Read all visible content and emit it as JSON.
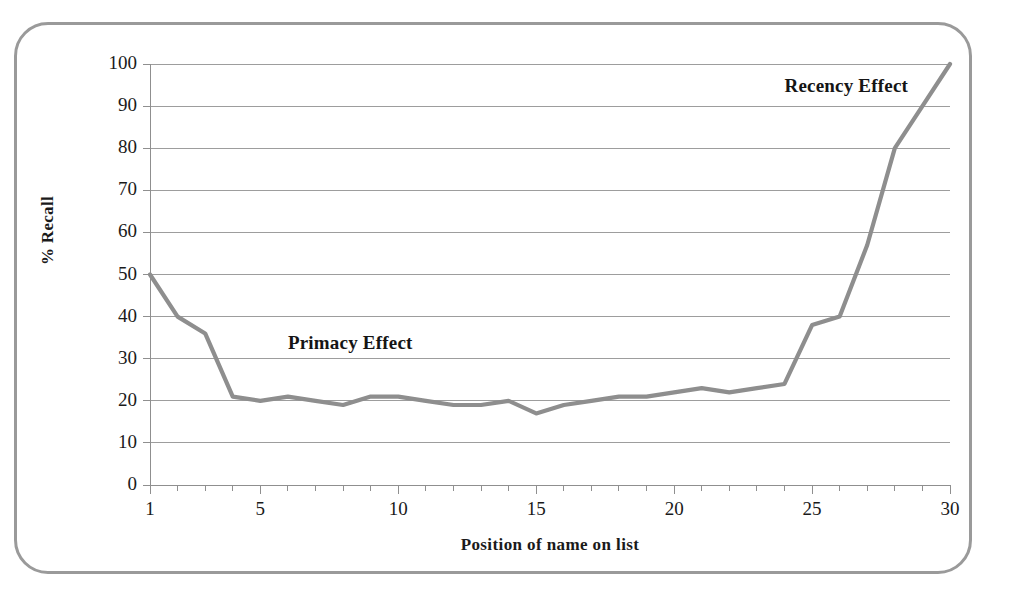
{
  "figure": {
    "border_color": "#9a9a9a",
    "background": "#ffffff"
  },
  "chart_data": {
    "type": "line",
    "title": "",
    "xlabel": "Position of name on list",
    "ylabel": "% Recall",
    "xlim": [
      1,
      30
    ],
    "ylim": [
      0,
      100
    ],
    "grid": true,
    "grid_axis": "y",
    "legend": "none",
    "line_color": "#8e8e8e",
    "x": [
      1,
      2,
      3,
      4,
      5,
      6,
      7,
      8,
      9,
      10,
      11,
      12,
      13,
      14,
      15,
      16,
      17,
      18,
      19,
      20,
      21,
      22,
      23,
      24,
      25,
      26,
      27,
      28,
      29,
      30
    ],
    "values": [
      50,
      40,
      36,
      21,
      20,
      21,
      20,
      19,
      21,
      21,
      20,
      19,
      19,
      20,
      17,
      19,
      20,
      21,
      21,
      22,
      23,
      22,
      23,
      24,
      38,
      40,
      57,
      80,
      90,
      100
    ],
    "y_ticks": [
      0,
      10,
      20,
      30,
      40,
      50,
      60,
      70,
      80,
      90,
      100
    ],
    "y_tick_labels": [
      "0",
      "10",
      "20",
      "30",
      "40",
      "50",
      "60",
      "70",
      "80",
      "90",
      "100"
    ],
    "x_ticks": [
      1,
      2,
      3,
      4,
      5,
      6,
      7,
      8,
      9,
      10,
      11,
      12,
      13,
      14,
      15,
      16,
      17,
      18,
      19,
      20,
      21,
      22,
      23,
      24,
      25,
      26,
      27,
      28,
      29,
      30
    ],
    "x_labeled_ticks": [
      1,
      5,
      10,
      15,
      20,
      25,
      30
    ],
    "x_tick_labels": [
      "1",
      "5",
      "10",
      "15",
      "20",
      "25",
      "30"
    ],
    "annotations": [
      {
        "text": "Primacy Effect",
        "x": 6.0,
        "y": 33.5,
        "name": "primacy-effect-annotation"
      },
      {
        "text": "Recency Effect",
        "x": 24.0,
        "y": 94.5,
        "name": "recency-effect-annotation"
      }
    ]
  }
}
